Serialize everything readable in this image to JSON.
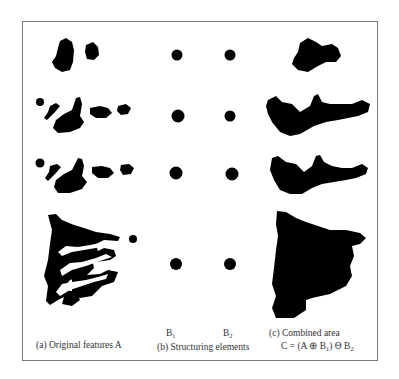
{
  "figure": {
    "panels": {
      "a": {
        "caption": "(a) Original features A"
      },
      "b": {
        "caption": "(b) Structuring elements",
        "b1": "B",
        "b1_sub": "1",
        "b2": "B",
        "b2_sub": "2"
      },
      "c": {
        "caption": "(c) Combined area",
        "formula_prefix": "C = (A ⊕ B",
        "formula_sub1": "1",
        "formula_mid": ") Θ B",
        "formula_sub2": "2"
      }
    },
    "colors": {
      "ink": "#000000",
      "border": "#7a7a7a",
      "text": "#333333"
    },
    "rows": 4
  }
}
